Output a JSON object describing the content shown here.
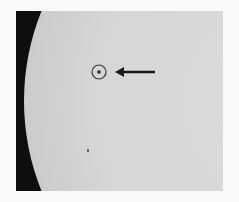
{
  "image": {
    "subject": "solar disk limb with marked spot",
    "elements": {
      "marker_circle": {
        "cx": 99,
        "cy": 72,
        "r": 7,
        "color": "#3a3a3a"
      },
      "marker_dot": {
        "cx": 99,
        "cy": 72,
        "r": 2,
        "color": "#222222"
      },
      "arrow": {
        "x1": 155,
        "y1": 72,
        "x2": 116,
        "y2": 72,
        "color": "#1a1a1a",
        "direction": "left"
      },
      "speck": {
        "cx": 88,
        "cy": 150,
        "color": "#555555"
      }
    },
    "colors": {
      "background": "#fafafa",
      "sky": "#0e0e0e",
      "disk": "#d6d6d6"
    }
  }
}
